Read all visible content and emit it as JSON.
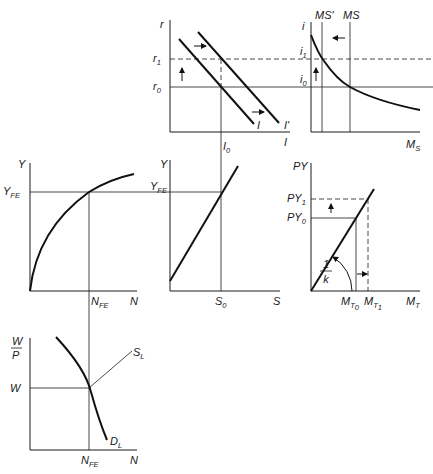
{
  "diagram": {
    "colors": {
      "ink": "#1a1a1a",
      "background": "#ffffff"
    },
    "panels": {
      "investment": {
        "y_axis": "r",
        "x_axis": "I",
        "ticks_y": [
          "r",
          "1",
          "r",
          "0"
        ],
        "r1": "r",
        "r1_sub": "1",
        "r0": "r",
        "r0_sub": "0",
        "i0": "I",
        "i0_sub": "0",
        "curve_i": "I",
        "curve_i_prime": "I'",
        "shift": "right"
      },
      "money_market": {
        "y_axis": "i",
        "x_axis": "M",
        "x_axis_sub": "S",
        "ms_prime": "MS'",
        "ms": "MS",
        "i1": "i",
        "i1_sub": "1",
        "i0": "i",
        "i0_sub": "0",
        "shift": "left"
      },
      "production": {
        "y_axis": "Y",
        "x_axis": "N",
        "yfe": "Y",
        "yfe_sub": "FE",
        "nfe": "N",
        "nfe_sub": "FE"
      },
      "savings": {
        "y_axis": "Y",
        "x_axis": "S",
        "yfe": "Y",
        "yfe_sub": "FE",
        "s0": "S",
        "s0_sub": "0"
      },
      "money_demand": {
        "y_axis": "PY",
        "x_axis": "M",
        "x_axis_sub": "T",
        "py1": "PY",
        "py1_sub": "1",
        "py0": "PY",
        "py0_sub": "0",
        "mt0": "M",
        "mt0_sub": "T",
        "mt0_subsub": "0",
        "mt1": "M",
        "mt1_sub": "T",
        "mt1_subsub": "1",
        "slope_num": "1",
        "slope_den": "k"
      },
      "labor": {
        "y_axis_num": "W",
        "y_axis_den": "P",
        "x_axis": "N",
        "w": "W",
        "nfe": "N",
        "nfe_sub": "FE",
        "supply": "S",
        "supply_sub": "L",
        "demand": "D",
        "demand_sub": "L"
      }
    }
  }
}
